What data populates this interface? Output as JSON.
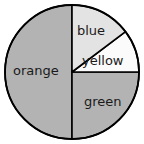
{
  "figure": {
    "background_color": "#ffffff",
    "outline_color": "#000000",
    "label_color": "#1a1a1a"
  },
  "chart_data": {
    "type": "pie",
    "title": "",
    "subtitle": "",
    "xlabel": "",
    "ylabel": "",
    "grid": false,
    "legend_position": "none",
    "labels_inside_slices": true,
    "center_px": [
      72,
      72
    ],
    "radius_px": 67,
    "start_angle_deg": 90,
    "direction": "counterclockwise",
    "categories": [
      "blue",
      "orange",
      "green",
      "yellow"
    ],
    "values": [
      14.7,
      50.0,
      25.0,
      10.3
    ],
    "units": "percent",
    "slices": [
      {
        "label": "blue",
        "value": 14.7,
        "angle_deg": 53,
        "start_angle_deg": 90,
        "end_angle_deg": 37,
        "fill": "#e3e3e3"
      },
      {
        "label": "yellow",
        "value": 10.3,
        "angle_deg": 37,
        "start_angle_deg": 37,
        "end_angle_deg": 0,
        "fill": "#fbfbfb"
      },
      {
        "label": "green",
        "value": 25.0,
        "angle_deg": 90,
        "start_angle_deg": 0,
        "end_angle_deg": -90,
        "fill": "#b3b3b3"
      },
      {
        "label": "orange",
        "value": 50.0,
        "angle_deg": 180,
        "start_angle_deg": -90,
        "end_angle_deg": -270,
        "fill": "#b3b3b3"
      }
    ]
  }
}
